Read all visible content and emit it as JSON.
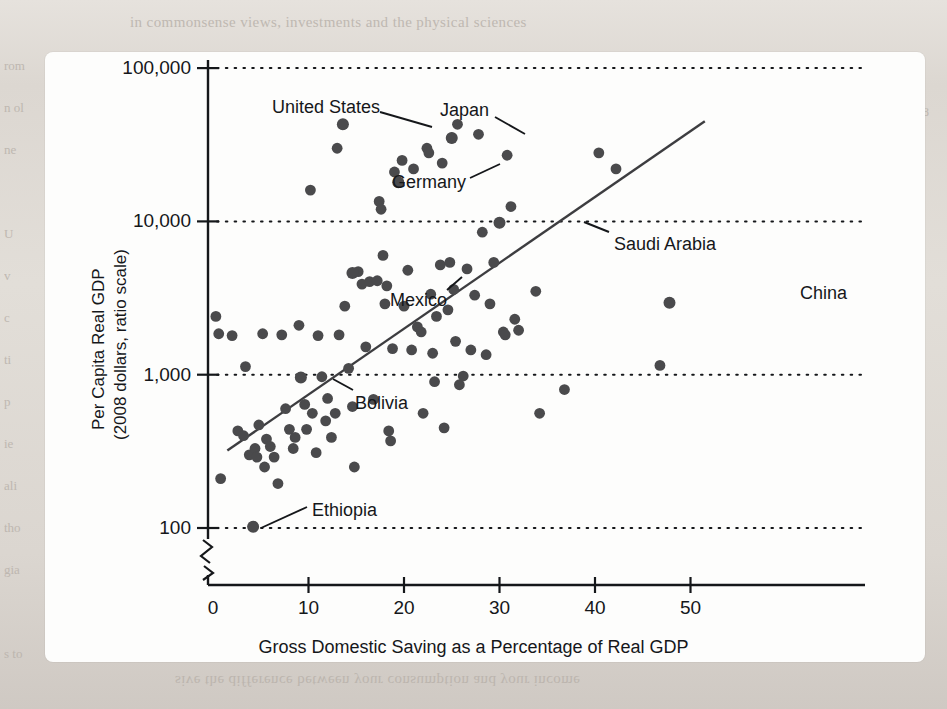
{
  "figure": {
    "background_color": "#fdfdfc",
    "page_color": "#ded9d4",
    "ink_color": "#15171a",
    "point_color": "#4a4a4c",
    "ghost_text_top": "in commonsense views, investments and the physical sciences",
    "ghost_text_bottom": "sive the difference between your consumption and your income",
    "ghost_left_lines": [
      "rom",
      "n ol",
      "ne",
      "",
      "U",
      "v",
      "c",
      "ti",
      "p",
      "ie",
      "ali",
      "tho",
      "gia",
      "",
      "s to"
    ],
    "ghost_right_lines": [
      "ti",
      "18",
      "",
      "c",
      "r",
      "",
      "i",
      "",
      "n",
      "",
      "",
      "i",
      "",
      "C"
    ]
  },
  "chart_data": {
    "type": "scatter",
    "title": "",
    "xlabel": "Gross Domestic Saving as a Percentage of Real GDP",
    "ylabel": "Per Capita Real GDP\n(2008 dollars, ratio scale)",
    "ylabel_line1": "Per Capita Real GDP",
    "ylabel_line2": "(2008 dollars, ratio scale)",
    "yscale": "log",
    "xlim": [
      0,
      56
    ],
    "ylim": [
      90,
      100000
    ],
    "grid": "horizontal-dotted",
    "axis_break": true,
    "legend": "none",
    "xticks": [
      0,
      10,
      20,
      30,
      40,
      50
    ],
    "xticklabels": [
      "0",
      "10",
      "20",
      "30",
      "40",
      "50"
    ],
    "yticks": [
      100,
      1000,
      10000,
      100000
    ],
    "yticklabels": [
      "100",
      "1,000",
      "10,000",
      "100,000"
    ],
    "trendline": {
      "label": "fitted regression line",
      "x0": 1.5,
      "y0": 320,
      "x1": 51.5,
      "y1": 45000
    },
    "points": [
      {
        "x": 0.3,
        "y": 2400
      },
      {
        "x": 0.6,
        "y": 1850
      },
      {
        "x": 0.8,
        "y": 210
      },
      {
        "x": 2.0,
        "y": 1800
      },
      {
        "x": 2.6,
        "y": 430
      },
      {
        "x": 3.2,
        "y": 400
      },
      {
        "x": 3.4,
        "y": 1130
      },
      {
        "x": 3.8,
        "y": 300
      },
      {
        "x": 4.2,
        "y": 102
      },
      {
        "x": 4.4,
        "y": 330
      },
      {
        "x": 4.6,
        "y": 290
      },
      {
        "x": 4.8,
        "y": 470
      },
      {
        "x": 5.2,
        "y": 1850
      },
      {
        "x": 5.4,
        "y": 250
      },
      {
        "x": 5.6,
        "y": 380
      },
      {
        "x": 6.0,
        "y": 340
      },
      {
        "x": 6.4,
        "y": 290
      },
      {
        "x": 6.8,
        "y": 195
      },
      {
        "x": 7.2,
        "y": 1820
      },
      {
        "x": 7.6,
        "y": 600
      },
      {
        "x": 8.0,
        "y": 440
      },
      {
        "x": 8.4,
        "y": 330
      },
      {
        "x": 8.6,
        "y": 390
      },
      {
        "x": 9.0,
        "y": 2100
      },
      {
        "x": 9.2,
        "y": 960
      },
      {
        "x": 9.6,
        "y": 640
      },
      {
        "x": 9.8,
        "y": 440
      },
      {
        "x": 10.2,
        "y": 16000
      },
      {
        "x": 10.4,
        "y": 560
      },
      {
        "x": 10.8,
        "y": 310
      },
      {
        "x": 11.0,
        "y": 1800
      },
      {
        "x": 11.4,
        "y": 970
      },
      {
        "x": 11.8,
        "y": 500
      },
      {
        "x": 12.0,
        "y": 700
      },
      {
        "x": 12.4,
        "y": 390
      },
      {
        "x": 12.8,
        "y": 560
      },
      {
        "x": 13.0,
        "y": 30000
      },
      {
        "x": 13.2,
        "y": 1820
      },
      {
        "x": 13.6,
        "y": 43000
      },
      {
        "x": 13.8,
        "y": 2800
      },
      {
        "x": 14.2,
        "y": 1100
      },
      {
        "x": 14.6,
        "y": 620
      },
      {
        "x": 14.8,
        "y": 250
      },
      {
        "x": 15.2,
        "y": 4700
      },
      {
        "x": 15.6,
        "y": 3900
      },
      {
        "x": 16.0,
        "y": 1520
      },
      {
        "x": 16.4,
        "y": 4050
      },
      {
        "x": 16.8,
        "y": 690
      },
      {
        "x": 17.2,
        "y": 4100
      },
      {
        "x": 17.4,
        "y": 13500
      },
      {
        "x": 17.6,
        "y": 12000
      },
      {
        "x": 17.8,
        "y": 6000
      },
      {
        "x": 18.0,
        "y": 2900
      },
      {
        "x": 18.2,
        "y": 3800
      },
      {
        "x": 18.4,
        "y": 430
      },
      {
        "x": 18.6,
        "y": 370
      },
      {
        "x": 18.8,
        "y": 1480
      },
      {
        "x": 19.0,
        "y": 21000
      },
      {
        "x": 19.4,
        "y": 18000
      },
      {
        "x": 19.8,
        "y": 25000
      },
      {
        "x": 20.0,
        "y": 2800
      },
      {
        "x": 20.4,
        "y": 4800
      },
      {
        "x": 20.8,
        "y": 1450
      },
      {
        "x": 21.0,
        "y": 22000
      },
      {
        "x": 21.4,
        "y": 2050
      },
      {
        "x": 21.8,
        "y": 1900
      },
      {
        "x": 22.0,
        "y": 560
      },
      {
        "x": 22.4,
        "y": 30000
      },
      {
        "x": 22.6,
        "y": 28000
      },
      {
        "x": 22.8,
        "y": 3350
      },
      {
        "x": 23.0,
        "y": 1380
      },
      {
        "x": 23.2,
        "y": 900
      },
      {
        "x": 23.4,
        "y": 2400
      },
      {
        "x": 23.8,
        "y": 5200
      },
      {
        "x": 24.0,
        "y": 24000
      },
      {
        "x": 24.2,
        "y": 450
      },
      {
        "x": 24.6,
        "y": 2650
      },
      {
        "x": 24.8,
        "y": 5400
      },
      {
        "x": 25.0,
        "y": 35000
      },
      {
        "x": 25.2,
        "y": 3600
      },
      {
        "x": 25.4,
        "y": 1650
      },
      {
        "x": 25.6,
        "y": 43000
      },
      {
        "x": 25.8,
        "y": 860
      },
      {
        "x": 26.2,
        "y": 980
      },
      {
        "x": 26.6,
        "y": 4900
      },
      {
        "x": 27.0,
        "y": 1450
      },
      {
        "x": 27.4,
        "y": 3300
      },
      {
        "x": 27.8,
        "y": 37000
      },
      {
        "x": 28.2,
        "y": 8500
      },
      {
        "x": 28.6,
        "y": 1350
      },
      {
        "x": 29.0,
        "y": 2900
      },
      {
        "x": 29.4,
        "y": 5400
      },
      {
        "x": 30.0,
        "y": 9800
      },
      {
        "x": 30.4,
        "y": 1900
      },
      {
        "x": 30.6,
        "y": 1820
      },
      {
        "x": 30.8,
        "y": 27000
      },
      {
        "x": 31.2,
        "y": 12500
      },
      {
        "x": 31.6,
        "y": 2300
      },
      {
        "x": 32.0,
        "y": 1950
      },
      {
        "x": 33.8,
        "y": 3500
      },
      {
        "x": 34.2,
        "y": 560
      },
      {
        "x": 36.8,
        "y": 800
      },
      {
        "x": 40.4,
        "y": 28000
      },
      {
        "x": 42.2,
        "y": 22000
      },
      {
        "x": 46.8,
        "y": 1150
      },
      {
        "x": 47.8,
        "y": 2950
      }
    ],
    "annotations": [
      {
        "label": "United States",
        "point_x": 13.6,
        "point_y": 43000,
        "text_x": 272,
        "text_y": 97,
        "leader": [
          [
            380,
            112
          ],
          [
            432,
            127
          ]
        ]
      },
      {
        "label": "Japan",
        "point_x": 25.0,
        "point_y": 35000,
        "text_x": 440,
        "text_y": 100,
        "leader": [
          [
            495,
            117
          ],
          [
            525,
            134
          ]
        ]
      },
      {
        "label": "Germany",
        "point_x": 19.4,
        "point_y": 18000,
        "text_x": 392,
        "text_y": 172,
        "leader": [
          [
            470,
            178
          ],
          [
            500,
            164
          ]
        ]
      },
      {
        "label": "Saudi Arabia",
        "point_x": 30.0,
        "point_y": 9800,
        "text_x": 614,
        "text_y": 234,
        "leader": [
          [
            609,
            232
          ],
          [
            584,
            222
          ]
        ]
      },
      {
        "label": "China",
        "point_x": 47.8,
        "point_y": 2950,
        "text_x": 800,
        "text_y": 283,
        "leader": []
      },
      {
        "label": "Mexico",
        "point_x": 14.6,
        "point_y": 4600,
        "text_x": 390,
        "text_y": 290,
        "leader": [
          [
            447,
            290
          ],
          [
            462,
            277
          ]
        ]
      },
      {
        "label": "Bolivia",
        "point_x": 9.2,
        "point_y": 960,
        "text_x": 355,
        "text_y": 393,
        "leader": [
          [
            353,
            390
          ],
          [
            333,
            379
          ]
        ]
      },
      {
        "label": "Ethiopia",
        "point_x": 4.2,
        "point_y": 102,
        "text_x": 312,
        "text_y": 500,
        "leader": [
          [
            307,
            507
          ],
          [
            261,
            528
          ]
        ]
      }
    ]
  }
}
